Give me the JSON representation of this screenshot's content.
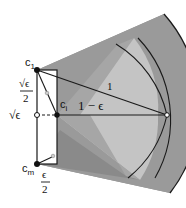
{
  "diagram": {
    "type": "geometric-construction",
    "colors": {
      "sector_dark": "#8f8f8f",
      "sector_mid": "#a6a6a6",
      "sector_light": "#c4c4c4",
      "stroke": "#1a1a1a",
      "background": "#ffffff"
    },
    "labels": {
      "c1": "c",
      "c1_sub": "1",
      "ci": "c",
      "ci_sub": "i",
      "cm": "c",
      "cm_sub": "m",
      "sqrt_eps_half_num": "√ϵ",
      "sqrt_eps_half_den": "2",
      "sqrt_eps": "√ϵ",
      "one": "1",
      "one_minus_eps": "1 − ϵ",
      "eps_half_num": "ϵ",
      "eps_half_den": "2"
    },
    "points": {
      "c1": {
        "x": 37,
        "y": 70,
        "style": "filled"
      },
      "ci": {
        "x": 57,
        "y": 115,
        "style": "filled"
      },
      "cm": {
        "x": 37,
        "y": 164,
        "style": "filled"
      },
      "left_mid": {
        "x": 37,
        "y": 115,
        "style": "open"
      },
      "right_end": {
        "x": 167,
        "y": 115,
        "style": "open"
      },
      "c1_inner": {
        "x": 47,
        "y": 96,
        "style": "open-small"
      },
      "cm_inner": {
        "x": 52,
        "y": 157,
        "style": "open-small"
      }
    }
  }
}
